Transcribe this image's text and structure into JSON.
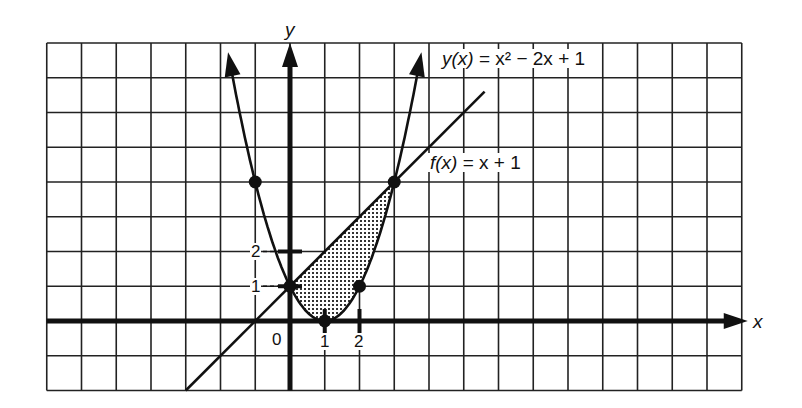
{
  "chart_data": {
    "type": "line",
    "title": "",
    "xlabel": "x",
    "ylabel": "y",
    "grid": true,
    "xlim": [
      -7,
      13
    ],
    "ylim": [
      -2,
      8
    ],
    "origin_px": [
      290,
      321
    ],
    "unit_px": 34.75,
    "series": [
      {
        "name": "y(x) = x² − 2x + 1",
        "type": "parabola",
        "expr": "x^2 - 2x + 1",
        "x_range": [
          -1.75,
          3.75
        ]
      },
      {
        "name": "f(x) = x + 1",
        "type": "line",
        "expr": "x + 1",
        "x_range": [
          -3,
          5.6
        ]
      }
    ],
    "points": [
      {
        "x": -1,
        "y": 4
      },
      {
        "x": 0,
        "y": 1
      },
      {
        "x": 1,
        "y": 0
      },
      {
        "x": 2,
        "y": 1
      },
      {
        "x": 3,
        "y": 4
      }
    ],
    "shaded_region": {
      "between": [
        "f(x) = x + 1",
        "y(x) = x² − 2x + 1"
      ],
      "x_from": 0,
      "x_to": 3
    },
    "x_ticks": [
      0,
      1,
      2
    ],
    "y_ticks": [
      1,
      2
    ],
    "legend_position": "inline labels on curves"
  },
  "labels": {
    "y_axis": "y",
    "x_axis": "x",
    "parabola_eq": {
      "lhs": "y(x)",
      "rhs": " = x² − 2x + 1"
    },
    "line_eq": {
      "lhs": "f(x)",
      "rhs": " = x + 1"
    },
    "origin": "0",
    "x_tick_1": "1",
    "x_tick_2": "2",
    "y_tick_1": "1",
    "y_tick_2": "2"
  },
  "colors": {
    "ink": "#111111",
    "paper": "#ffffff",
    "grid": "#222222",
    "shade": "#555555"
  }
}
